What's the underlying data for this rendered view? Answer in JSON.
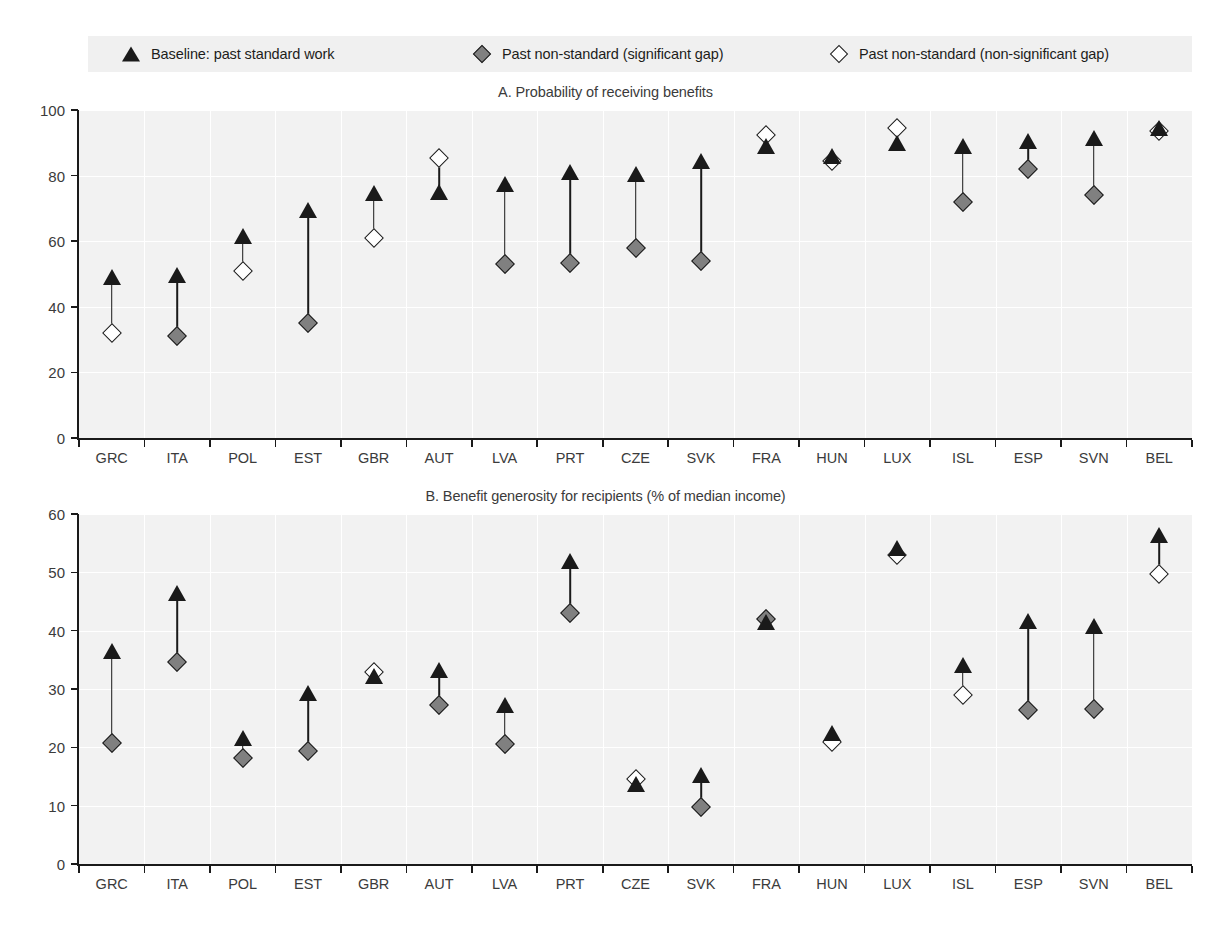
{
  "legend": {
    "items": [
      {
        "label": "Baseline: past standard work",
        "marker": "filled-triangle-icon"
      },
      {
        "label": "Past non-standard (significant gap)",
        "marker": "filled-diamond-icon"
      },
      {
        "label": "Past non-standard (non-significant gap)",
        "marker": "open-diamond-icon"
      }
    ]
  },
  "colors": {
    "marker_dark": "#1a1a1a",
    "marker_gray": "#808080",
    "marker_open": "#ffffff",
    "plot_background": "#f2f2f2",
    "legend_background": "#f0f0f0",
    "gridline": "#ffffff"
  },
  "chart_data": [
    {
      "type": "scatter",
      "title": "A. Probability of receiving benefits",
      "xlabel": "",
      "ylabel": "",
      "ylim": [
        0,
        100
      ],
      "yticks": [
        0,
        20,
        40,
        60,
        80,
        100
      ],
      "grid": true,
      "legend_position": "top",
      "categories": [
        "GRC",
        "ITA",
        "POL",
        "EST",
        "GBR",
        "AUT",
        "LVA",
        "PRT",
        "CZE",
        "SVK",
        "FRA",
        "HUN",
        "LUX",
        "ISL",
        "ESP",
        "SVN",
        "BEL"
      ],
      "series": [
        {
          "name": "Baseline: past standard work",
          "marker": "filled-triangle",
          "values": [
            50.0,
            50.5,
            62.5,
            70.5,
            75.5,
            76.0,
            78.5,
            82.0,
            81.5,
            85.5,
            90.0,
            87.0,
            91.0,
            90.0,
            91.5,
            92.5,
            95.5
          ]
        },
        {
          "name": "Past non-standard (significant gap)",
          "marker": "filled-diamond",
          "values": [
            null,
            31.0,
            null,
            35.0,
            null,
            null,
            53.0,
            53.5,
            58.0,
            54.0,
            null,
            null,
            null,
            72.0,
            82.0,
            74.0,
            null
          ]
        },
        {
          "name": "Past non-standard (non-significant gap)",
          "marker": "open-diamond",
          "values": [
            32.0,
            null,
            51.0,
            null,
            61.0,
            85.5,
            null,
            null,
            null,
            null,
            92.5,
            84.5,
            94.5,
            null,
            null,
            null,
            93.5
          ]
        }
      ]
    },
    {
      "type": "scatter",
      "title": "B. Benefit generosity for recipients (% of median income)",
      "xlabel": "",
      "ylabel": "",
      "ylim": [
        0,
        60
      ],
      "yticks": [
        0,
        10,
        20,
        30,
        40,
        50,
        60
      ],
      "grid": true,
      "legend_position": "top",
      "categories": [
        "GRC",
        "ITA",
        "POL",
        "EST",
        "GBR",
        "AUT",
        "LVA",
        "PRT",
        "CZE",
        "SVK",
        "FRA",
        "HUN",
        "LUX",
        "ISL",
        "ESP",
        "SVN",
        "BEL"
      ],
      "series": [
        {
          "name": "Baseline: past standard work",
          "marker": "filled-triangle",
          "values": [
            37.0,
            47.0,
            22.2,
            29.8,
            32.7,
            33.7,
            27.7,
            52.5,
            14.2,
            15.8,
            42.0,
            23.0,
            54.7,
            34.6,
            42.2,
            41.3,
            57.0
          ]
        },
        {
          "name": "Past non-standard (significant gap)",
          "marker": "filled-diamond",
          "values": [
            20.7,
            34.7,
            18.2,
            19.3,
            null,
            27.3,
            20.6,
            43.0,
            null,
            9.8,
            42.0,
            null,
            null,
            null,
            26.4,
            26.5,
            null
          ]
        },
        {
          "name": "Past non-standard (non-significant gap)",
          "marker": "open-diamond",
          "values": [
            null,
            null,
            null,
            null,
            33.0,
            null,
            null,
            null,
            14.5,
            null,
            46.0,
            21.0,
            53.0,
            29.0,
            null,
            null,
            49.8
          ]
        }
      ]
    }
  ]
}
